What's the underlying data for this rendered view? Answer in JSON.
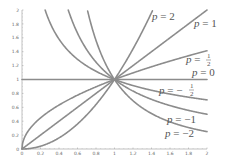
{
  "chart_data": {
    "type": "line",
    "title": "",
    "xlabel": "",
    "ylabel": "",
    "xlim": [
      0,
      2
    ],
    "ylim": [
      0,
      2
    ],
    "grid": false,
    "legend": "inline labels at right end of curves",
    "function": "y = x^p",
    "x_ticks": [
      "0",
      "0.2",
      "0.4",
      "0.6",
      "0.8",
      "1",
      "1.2",
      "1.4",
      "1.6",
      "1.8",
      "2"
    ],
    "y_ticks": [
      "0",
      "0.2",
      "0.4",
      "0.6",
      "0.8",
      "1",
      "1.2",
      "1.4",
      "1.6",
      "1.8",
      "2"
    ],
    "series": [
      {
        "name": "p = 2",
        "p": 2,
        "label": "p = 2"
      },
      {
        "name": "p = 1",
        "p": 1,
        "label": "p = 1"
      },
      {
        "name": "p = 1/2",
        "p": 0.5,
        "label": "p = 1/2"
      },
      {
        "name": "p = 0",
        "p": 0,
        "label": "p = 0"
      },
      {
        "name": "p = -1/2",
        "p": -0.5,
        "label": "p = -1/2"
      },
      {
        "name": "p = -1",
        "p": -1,
        "label": "p = -1"
      },
      {
        "name": "p = -2",
        "p": -2,
        "label": "p = -2"
      }
    ],
    "line_color": "#8c8c8c"
  },
  "labels": {
    "p2": {
      "var": "p",
      "eq": " = 2"
    },
    "p1": {
      "var": "p",
      "eq": " = 1"
    },
    "phalf": {
      "var": "p",
      "eq": " = ",
      "num": "1",
      "den": "2"
    },
    "p0": {
      "var": "p",
      "eq": " = 0"
    },
    "pneghalf": {
      "var": "p",
      "eq": " = −",
      "num": "1",
      "den": "2"
    },
    "pneg1": {
      "var": "p",
      "eq": " = −1"
    },
    "pneg2": {
      "var": "p",
      "eq": " = −2"
    }
  }
}
